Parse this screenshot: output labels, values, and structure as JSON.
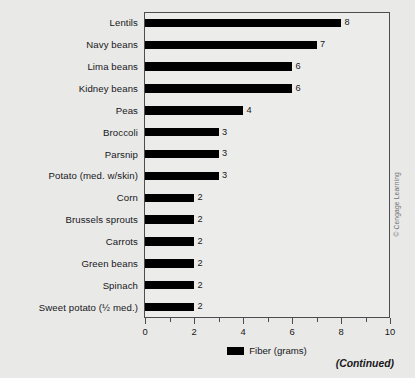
{
  "chart_data": {
    "type": "bar",
    "orientation": "horizontal",
    "title": "",
    "xlabel": "",
    "ylabel": "",
    "xlim": [
      0,
      10
    ],
    "xticks": [
      0,
      2,
      4,
      6,
      8,
      10
    ],
    "xtick_labels": [
      "0",
      "2",
      "4",
      "6",
      "8",
      "10"
    ],
    "minor_xticks": [
      1,
      3,
      5,
      7,
      9
    ],
    "grid": false,
    "legend": {
      "position": "bottom-center",
      "entries": [
        {
          "label": "Fiber (grams)",
          "color": "#000000"
        }
      ]
    },
    "categories": [
      "Lentils",
      "Navy beans",
      "Lima beans",
      "Kidney beans",
      "Peas",
      "Broccoli",
      "Parsnip",
      "Potato (med. w/skin)",
      "Corn",
      "Brussels sprouts",
      "Carrots",
      "Green beans",
      "Spinach",
      "Sweet potato (½ med.)"
    ],
    "values": [
      8,
      7,
      6,
      6,
      4,
      3,
      3,
      3,
      2,
      2,
      2,
      2,
      2,
      2
    ],
    "value_labels": [
      "8",
      "7",
      "6",
      "6",
      "4",
      "3",
      "3",
      "3",
      "2",
      "2",
      "2",
      "2",
      "2",
      "2"
    ],
    "series": [
      {
        "name": "Fiber (grams)",
        "values": [
          8,
          7,
          6,
          6,
          4,
          3,
          3,
          3,
          2,
          2,
          2,
          2,
          2,
          2
        ]
      }
    ]
  },
  "annotations": {
    "continued": "(Continued)",
    "credit": "© Cengage Learning"
  },
  "colors": {
    "bar": "#000000",
    "page_background": "#e9e9e7",
    "plot_background": "#ececea",
    "axis": "#4d4d51",
    "text": "#17171b",
    "credit_text": "#6e6e72"
  }
}
